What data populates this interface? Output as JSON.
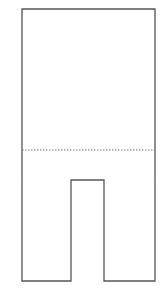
{
  "diagram": {
    "shape": "trousers-outline",
    "stroke_color": "#555555",
    "fold_line_color": "#777777",
    "outline_points": "22,9 155,9 155,281 104,281 104,180 71,180 71,281 22,281",
    "fold_line": {
      "x1": 22,
      "y1": 150,
      "x2": 155,
      "y2": 150
    }
  }
}
